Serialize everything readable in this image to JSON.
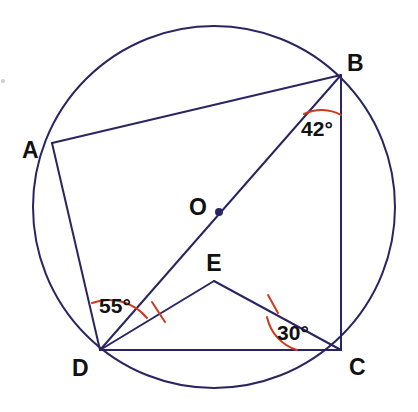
{
  "figure": {
    "background_color": "#ffffff",
    "line_color": "#2a2560",
    "arc_color": "#cf3a1e",
    "label_color": "#111111",
    "line_width": 2,
    "arc_width": 2
  },
  "circle": {
    "name": "circumcircle",
    "center_x": 214,
    "center_y": 207,
    "radius": 181,
    "stroke": "#2a2560"
  },
  "center_point": {
    "label": "O",
    "dot_x": 219,
    "dot_y": 212,
    "dot_radius": 4,
    "label_x": 189,
    "label_y": 215
  },
  "vertices": [
    {
      "id": "A",
      "label": "A",
      "x": 52,
      "y": 143,
      "label_x": 22,
      "label_y": 158
    },
    {
      "id": "B",
      "label": "B",
      "x": 341,
      "y": 75,
      "label_x": 347,
      "label_y": 71
    },
    {
      "id": "C",
      "label": "C",
      "x": 341,
      "y": 350,
      "label_x": 349,
      "label_y": 375
    },
    {
      "id": "D",
      "label": "D",
      "x": 100,
      "y": 350,
      "label_x": 72,
      "label_y": 376
    },
    {
      "id": "E",
      "label": "E",
      "x": 214,
      "y": 281,
      "label_x": 214,
      "label_y": 271
    }
  ],
  "segments": [
    {
      "name": "segment-AB",
      "from": "A",
      "to": "B"
    },
    {
      "name": "segment-AD",
      "from": "A",
      "to": "D"
    },
    {
      "name": "segment-BC",
      "from": "B",
      "to": "C"
    },
    {
      "name": "segment-DC",
      "from": "D",
      "to": "C"
    },
    {
      "name": "segment-DB",
      "from": "D",
      "to": "B"
    },
    {
      "name": "segment-DE",
      "from": "D",
      "to": "E"
    },
    {
      "name": "segment-EC",
      "from": "E",
      "to": "C"
    }
  ],
  "angles": [
    {
      "id": "angle-B",
      "label": "42°",
      "value": 42,
      "unit": "degrees",
      "at_vertex": "B",
      "between": [
        "BD",
        "BC"
      ],
      "label_x": 317,
      "label_y": 136,
      "arc_d": "M 304 114 A 40 40 0 0 1 341 115",
      "color": "#cf3a1e"
    },
    {
      "id": "angle-D",
      "label": "55°",
      "value": 55,
      "unit": "degrees",
      "at_vertex": "D",
      "between": [
        "DA",
        "DB"
      ],
      "label_x": 115,
      "label_y": 313,
      "arc_d": "M 92 303 A 49 49 0 0 1 147 318",
      "color": "#cf3a1e"
    },
    {
      "id": "angle-C",
      "label": "30°",
      "value": 30,
      "unit": "degrees",
      "at_vertex": "C",
      "between": [
        "CE",
        "CD"
      ],
      "label_x": 293,
      "label_y": 340,
      "arc_d": "M 267 317 A 44 44 0 0 0 297 350",
      "color": "#cf3a1e"
    }
  ],
  "tick_marks": [
    {
      "id": "tick-DE",
      "on_segment": "DE",
      "meaning": "equal-length-mark",
      "x1": 152,
      "y1": 302,
      "x2": 165,
      "y2": 322,
      "color": "#cf3a1e"
    },
    {
      "id": "tick-EC",
      "on_segment": "EC",
      "meaning": "equal-length-mark",
      "x1": 268,
      "y1": 295,
      "x2": 278,
      "y2": 313,
      "color": "#cf3a1e"
    }
  ],
  "artifact": {
    "name": "scan-speck",
    "x": 1,
    "y": 79,
    "size": 4
  }
}
